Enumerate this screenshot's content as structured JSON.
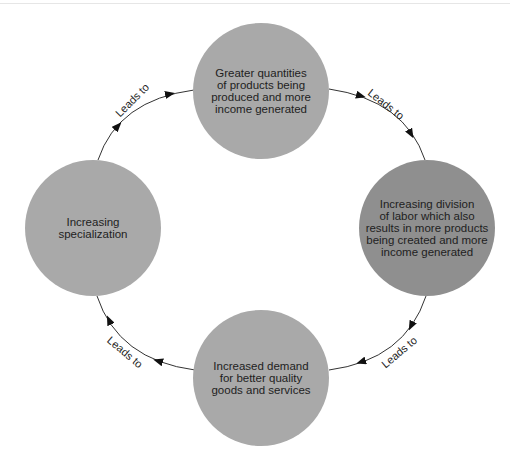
{
  "diagram": {
    "type": "cycle",
    "colors": {
      "node_light": "#a9a9a9",
      "node_dark": "#8f8f8f",
      "edge": "#333333",
      "text": "#1e1e1e"
    },
    "nodes": [
      {
        "id": "top",
        "label": "Greater quantities\nof products being\nproduced and more\nincome generated",
        "shade": "light"
      },
      {
        "id": "right",
        "label": "Increasing division\nof labor which also\nresults in more products\nbeing created and more\nincome generated",
        "shade": "dark"
      },
      {
        "id": "bottom",
        "label": "Increased demand\nfor better quality\ngoods and services",
        "shade": "light"
      },
      {
        "id": "left",
        "label": "Increasing\nspecialization",
        "shade": "light"
      }
    ],
    "edges": [
      {
        "from": "left",
        "to": "top",
        "label": "Leads to"
      },
      {
        "from": "top",
        "to": "right",
        "label": "Leads to"
      },
      {
        "from": "right",
        "to": "bottom",
        "label": "Leads to"
      },
      {
        "from": "bottom",
        "to": "left",
        "label": "Leads to"
      }
    ]
  }
}
